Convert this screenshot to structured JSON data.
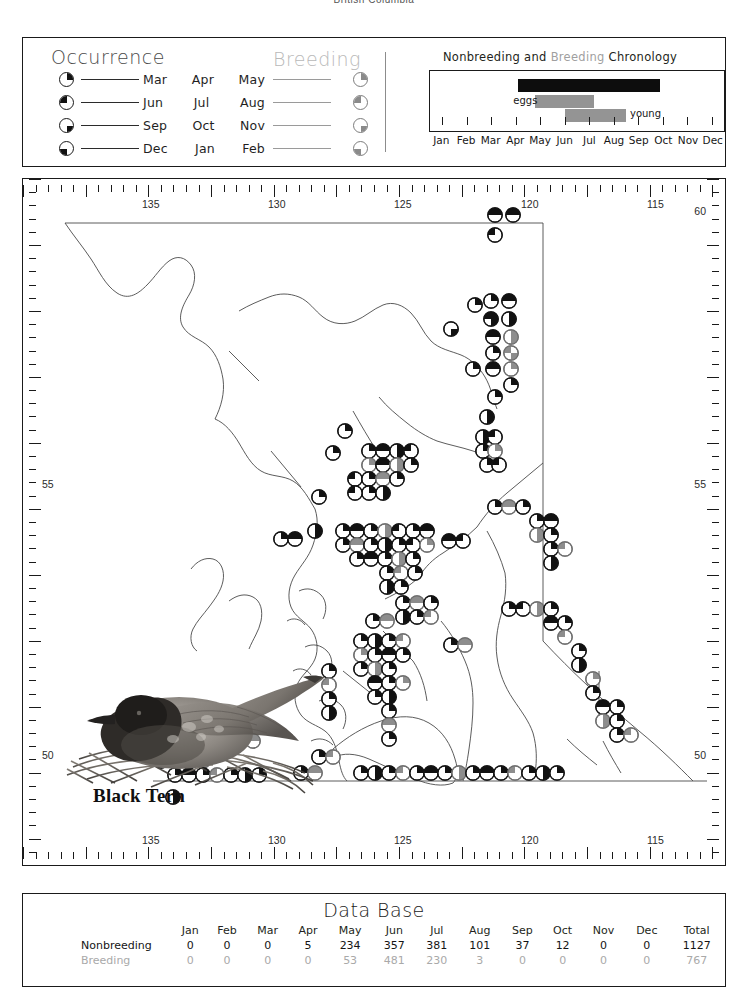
{
  "page_header": "British Columbia",
  "legend": {
    "occurrence_title": "Occurrence",
    "breeding_title": "Breeding",
    "rows": [
      {
        "months": [
          "Mar",
          "Apr",
          "May"
        ],
        "symbol": "pie-top-right"
      },
      {
        "months": [
          "Jun",
          "Jul",
          "Aug"
        ],
        "symbol": "pie-top-left"
      },
      {
        "months": [
          "Sep",
          "Oct",
          "Nov"
        ],
        "symbol": "pie-bottom-right"
      },
      {
        "months": [
          "Dec",
          "Jan",
          "Feb"
        ],
        "symbol": "pie-bottom-left"
      }
    ]
  },
  "chronology": {
    "title_part1": "Nonbreeding",
    "title_and": "and",
    "title_part2": "Breeding",
    "title_part3": "Chronology",
    "months": [
      "Jan",
      "Feb",
      "Mar",
      "Apr",
      "May",
      "Jun",
      "Jul",
      "Aug",
      "Sep",
      "Oct",
      "Nov",
      "Dec"
    ],
    "eggs_label": "eggs",
    "young_label": "young",
    "bars": [
      {
        "name": "nonbreeding",
        "color": "#0d0d0d",
        "start_month": 3.6,
        "end_month": 9.4,
        "row": 0
      },
      {
        "name": "eggs",
        "color": "#949494",
        "start_month": 4.3,
        "end_month": 6.7,
        "row": 1
      },
      {
        "name": "young",
        "color": "#949494",
        "start_month": 5.5,
        "end_month": 8.0,
        "row": 2
      }
    ]
  },
  "map": {
    "species_name": "Black Tern",
    "illustration": "black-tern-on-nest",
    "longitude_labels": [
      "135",
      "130",
      "125",
      "120",
      "115"
    ],
    "latitude_labels": [
      "60",
      "55",
      "50"
    ],
    "symbol_legend_note": "quarter-pie occurrence symbols"
  },
  "database": {
    "title": "Data Base",
    "columns": [
      "",
      "Jan",
      "Feb",
      "Mar",
      "Apr",
      "May",
      "Jun",
      "Jul",
      "Aug",
      "Sep",
      "Oct",
      "Nov",
      "Dec",
      "Total"
    ],
    "rows": [
      {
        "label": "Nonbreeding",
        "style": "nonbreeding",
        "values": [
          "0",
          "0",
          "0",
          "5",
          "234",
          "357",
          "381",
          "101",
          "37",
          "12",
          "0",
          "0",
          "1127"
        ]
      },
      {
        "label": "Breeding",
        "style": "breeding",
        "values": [
          "0",
          "0",
          "0",
          "0",
          "53",
          "481",
          "230",
          "3",
          "0",
          "0",
          "0",
          "0",
          "767"
        ]
      }
    ]
  },
  "chart_data": {
    "type": "bar",
    "title": "Data Base",
    "categories": [
      "Jan",
      "Feb",
      "Mar",
      "Apr",
      "May",
      "Jun",
      "Jul",
      "Aug",
      "Sep",
      "Oct",
      "Nov",
      "Dec"
    ],
    "series": [
      {
        "name": "Nonbreeding",
        "values": [
          0,
          0,
          0,
          5,
          234,
          357,
          381,
          101,
          37,
          12,
          0,
          0
        ],
        "total": 1127,
        "color": "#141414"
      },
      {
        "name": "Breeding",
        "values": [
          0,
          0,
          0,
          0,
          53,
          481,
          230,
          3,
          0,
          0,
          0,
          0
        ],
        "total": 767,
        "color": "#a9a9a9"
      }
    ],
    "xlabel": "Month",
    "ylabel": "Records",
    "grid": false,
    "legend_position": "left"
  },
  "colors": {
    "ink": "#1a1a1a",
    "gray": "#949494",
    "light_gray": "#b9b9b9"
  }
}
